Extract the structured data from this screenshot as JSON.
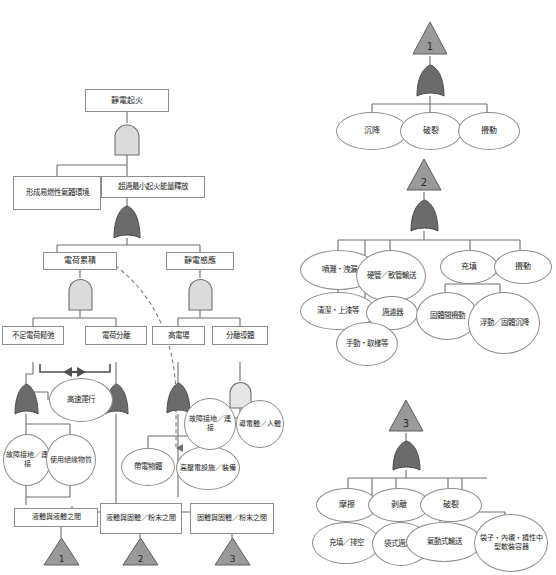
{
  "diagram": {
    "colors": {
      "and_gate_fill": "#dcdcdc",
      "or_gate_fill": "#6b6b6b",
      "transfer_fill": "#9a9a9a",
      "outline": "#8d8d8d",
      "line": "#6e6e6e",
      "dashed": "#7a7a7a"
    },
    "left_tree": {
      "top_event": "靜電起火",
      "n_flammable_env": "形成易燃性氣體環境",
      "n_min_ignition": "超過最小起火能量釋放",
      "n_charge_accum": "電荷累積",
      "n_static_induction": "靜電感應",
      "n_insufficient_relax": "不足電荷鬆弛",
      "n_charge_separation": "電荷分離",
      "n_high_field": "高電場",
      "n_isolated_conductor": "分離導體",
      "n_high_speed": "高速運行",
      "n_fault_ground_a": "故障接地／連接",
      "n_insulating_material": "使用絕緣物質",
      "n_charged_object": "帶電物體",
      "n_hv_equipment": "高壓電設施／裝備",
      "n_fault_ground_b": "故障接地／連接",
      "n_conductor_human": "導電體／人體",
      "n_liquid_liquid": "液體與液體之間",
      "n_liquid_solid": "液體與固體／粉末之間",
      "n_solid_solid": "固體與固體／粉末之間",
      "transfer_1": "1",
      "transfer_2": "2",
      "transfer_3": "3"
    },
    "transfer_1_tree": {
      "id": "1",
      "children": [
        "沉降",
        "破裂",
        "攪動"
      ]
    },
    "transfer_2_tree": {
      "id": "2",
      "children": [
        "噴濺・洩漏",
        "硬管／軟管輸送",
        "充填",
        "攪動"
      ],
      "sub": [
        "清潔・上漆等",
        "過濾器",
        "手動・取樣等",
        "固體間攪動",
        "浮動／固體沉降"
      ]
    },
    "transfer_3_tree": {
      "id": "3",
      "children": [
        "摩擦",
        "剥離",
        "破裂"
      ],
      "sub": [
        "充填／排空",
        "袋式過濾器",
        "氣動式輸送",
        "袋子・內襯・撓性中型散裝容器"
      ]
    }
  }
}
